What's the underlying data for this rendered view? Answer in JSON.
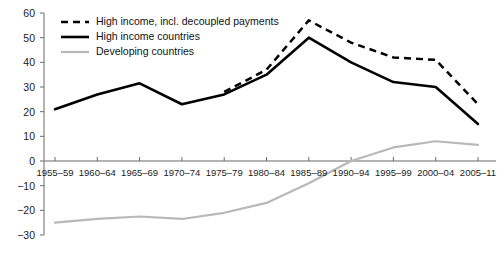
{
  "chart_data": {
    "type": "line",
    "title": "",
    "subtitle": "",
    "xlabel": "",
    "ylabel": "",
    "ylim": [
      -30,
      60
    ],
    "xlim": [
      0,
      10
    ],
    "grid": false,
    "legend_position": "top-left",
    "categories": [
      "1955–59",
      "1960–64",
      "1965–69",
      "1970–74",
      "1975–79",
      "1980–84",
      "1985–89",
      "1990–94",
      "1995–99",
      "2000–04",
      "2005–11"
    ],
    "ytick_labels": [
      "60",
      "50",
      "40",
      "30",
      "20",
      "10",
      "0",
      "−10",
      "−20",
      "−30"
    ],
    "ytick_values": [
      60,
      50,
      40,
      30,
      20,
      10,
      0,
      -10,
      -20,
      -30
    ],
    "series": [
      {
        "name": "High income, incl. decoupled payments",
        "style": "dashed",
        "color": "#000000",
        "values": [
          null,
          null,
          null,
          null,
          28,
          37,
          57,
          48,
          42,
          41,
          23
        ]
      },
      {
        "name": "High income countries",
        "style": "solid",
        "color": "#000000",
        "values": [
          21,
          27,
          31.5,
          23,
          27,
          35,
          50,
          40,
          32,
          30,
          15
        ]
      },
      {
        "name": "Developing countries",
        "style": "solid-light",
        "color": "#b8b8b8",
        "values": [
          -25,
          -23.5,
          -22.5,
          -23.5,
          -21,
          -17,
          -9,
          0,
          5.5,
          8,
          6.5
        ]
      }
    ]
  },
  "legend": {
    "items": [
      {
        "label": "High income, incl. decoupled payments",
        "swatch": "dashed-black-line"
      },
      {
        "label": "High income countries",
        "swatch": "solid-black-line"
      },
      {
        "label": "Developing countries",
        "swatch": "solid-gray-line"
      }
    ]
  },
  "axis": {
    "zero_line_color": "#9a9a9a",
    "axis_color": "#6b6b6b"
  }
}
